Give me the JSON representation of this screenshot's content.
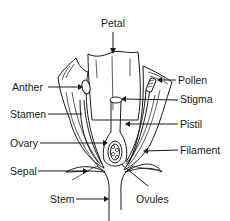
{
  "diagram": {
    "labels": {
      "petal": "Petal",
      "anther": "Anther",
      "pollen": "Pollen",
      "stigma": "Stigma",
      "stamen": "Stamen",
      "pistil": "Pistil",
      "ovary": "Ovary",
      "filament": "Filament",
      "sepal": "Sepal",
      "stem": "Stem",
      "ovules": "Ovules"
    },
    "colors": {
      "line": "#1a1a1a",
      "background": "#ffffff"
    }
  }
}
